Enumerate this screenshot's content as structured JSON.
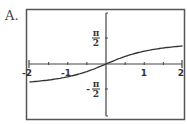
{
  "label": "A.",
  "chart_data": {
    "type": "line",
    "title": "",
    "function": "y = arctan(x)",
    "xlabel": "",
    "ylabel": "",
    "xlim": [
      -2,
      2
    ],
    "ylim": [
      -3.14,
      3.14
    ],
    "x_ticks": [
      -2,
      -1.5,
      -1,
      -0.5,
      0,
      0.5,
      1,
      1.5,
      2
    ],
    "x_tick_labels": [
      "-2",
      "-1",
      "1",
      "2"
    ],
    "y_tick_labels": [
      "π/2",
      "-π/2"
    ],
    "y_tick_values": [
      1.5708,
      -1.5708
    ],
    "grid": false,
    "legend": null,
    "series": [
      {
        "name": "arctan(x)",
        "x": [
          -2,
          -1.5,
          -1,
          -0.5,
          0,
          0.5,
          1,
          1.5,
          2
        ],
        "values": [
          -1.107,
          -0.983,
          -0.785,
          -0.464,
          0,
          0.464,
          0.785,
          0.983,
          1.107
        ]
      }
    ]
  },
  "labels": {
    "x_neg2": "-2",
    "x_neg1": "-1",
    "x_pos1": "1",
    "x_pos2": "2",
    "pi": "π",
    "two": "2",
    "minus": "-"
  }
}
